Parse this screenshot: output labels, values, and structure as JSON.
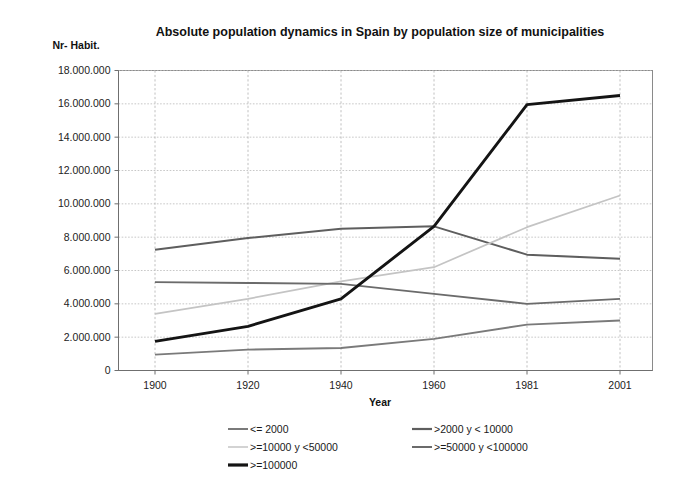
{
  "chart_data": {
    "type": "line",
    "title": "Absolute population dynamics in Spain by population size of municipalities",
    "xlabel": "Year",
    "ylabel": "Nr- Habit.",
    "categories": [
      "1900",
      "1920",
      "1940",
      "1960",
      "1981",
      "2001"
    ],
    "x": [
      1900,
      1920,
      1940,
      1960,
      1981,
      2001
    ],
    "ylim": [
      0,
      18000000
    ],
    "ytick_labels": [
      "0",
      "2.000.000",
      "4.000.000",
      "6.000.000",
      "8.000.000",
      "10.000.000",
      "12.000.000",
      "14.000.000",
      "16.000.000",
      "18.000.000"
    ],
    "ytick_values": [
      0,
      2000000,
      4000000,
      6000000,
      8000000,
      10000000,
      12000000,
      14000000,
      16000000,
      18000000
    ],
    "grid": true,
    "legend_position": "bottom",
    "series": [
      {
        "name": "<= 2000",
        "color": "#7a7a7a",
        "width": 1.9,
        "values": [
          950000,
          1250000,
          1350000,
          1900000,
          2750000,
          3000000
        ]
      },
      {
        "name": ">2000 y < 10000",
        "color": "#5e5e5e",
        "width": 2.0,
        "values": [
          7250000,
          7950000,
          8500000,
          8650000,
          6950000,
          6700000
        ]
      },
      {
        "name": ">=10000 y <50000",
        "color": "#c4c4c4",
        "width": 1.7,
        "values": [
          3400000,
          4300000,
          5350000,
          6200000,
          8600000,
          10500000
        ]
      },
      {
        "name": ">=50000 y <100000",
        "color": "#6b6b6b",
        "width": 1.9,
        "values": [
          5300000,
          5250000,
          5200000,
          4600000,
          4000000,
          4300000
        ]
      },
      {
        "name": ">=100000",
        "color": "#141414",
        "width": 2.9,
        "values": [
          1750000,
          2650000,
          4300000,
          8650000,
          15950000,
          16500000
        ]
      }
    ]
  },
  "legend": {
    "items": [
      {
        "label": "<= 2000",
        "color": "#7a7a7a",
        "width": 2.0
      },
      {
        "label": ">2000 y < 10000",
        "color": "#5e5e5e",
        "width": 2.2
      },
      {
        "label": ">=10000 y <50000",
        "color": "#c4c4c4",
        "width": 1.5
      },
      {
        "label": ">=50000 y <100000",
        "color": "#6b6b6b",
        "width": 2.0
      },
      {
        "label": ">=100000",
        "color": "#141414",
        "width": 3.2
      }
    ]
  }
}
